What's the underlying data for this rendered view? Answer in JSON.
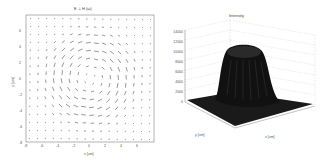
{
  "chart_data": [
    {
      "type": "quiver",
      "title": "E ⊥ H (ω)",
      "xlabel": "x [um]",
      "ylabel": "y [um]",
      "xticks": [
        "-8",
        "-6",
        "-4",
        "-2",
        "0",
        "2",
        "4",
        "6"
      ],
      "yticks": [
        "6",
        "4",
        "2",
        "0",
        "-2",
        "-4",
        "-6",
        "-8"
      ],
      "xlim": [
        -8,
        8
      ],
      "ylim": [
        -8,
        8
      ],
      "grid": false,
      "description": "Vector field with vortex-like circulation around the origin"
    },
    {
      "type": "surface",
      "title": "Intensity",
      "xlabel": "x [um]",
      "ylabel": "y [um]",
      "zticks": [
        "0",
        "2000",
        "4000",
        "6000",
        "8000",
        "10000",
        "12000",
        "14000"
      ],
      "xticks": [
        "-10",
        "-5",
        "0",
        "5",
        "10"
      ],
      "yticks": [
        "10",
        "5",
        "0",
        "-5",
        "-10"
      ],
      "zlim": [
        0,
        14000
      ],
      "grid": true,
      "description": "Flat-top intensity profile peaking near 14000 at center"
    }
  ]
}
